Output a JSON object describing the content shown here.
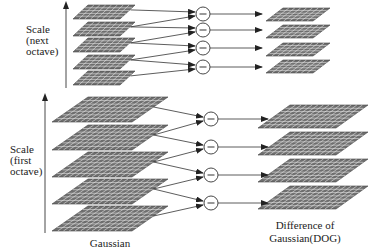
{
  "diagram": {
    "labels": {
      "scale_next_octave": "Scale\n(next\noctave)",
      "scale_first_octave": "Scale\n(first\noctave)",
      "gaussian": "Gaussian",
      "dog_line1": "Difference of",
      "dog_line2": "Gaussian(DOG)"
    },
    "operator_symbol": "−",
    "octaves": [
      {
        "name": "next octave",
        "gaussian_layers": 5,
        "dog_layers": 4,
        "subtraction_nodes": 4
      },
      {
        "name": "first octave",
        "gaussian_layers": 5,
        "dog_layers": 4,
        "subtraction_nodes": 4
      }
    ],
    "colors": {
      "grid_fill": "#6e6e6e",
      "grid_lines": "#e8e8e8",
      "stroke": "#333333",
      "background": "#ffffff"
    }
  }
}
